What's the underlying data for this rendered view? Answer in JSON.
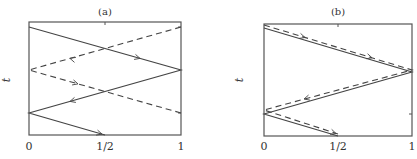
{
  "figure": {
    "panels": [
      {
        "id": "a",
        "title": "(a)",
        "ylabel": "t",
        "xticks": [
          "0",
          "1/2",
          "1"
        ],
        "frame": {
          "x": 29,
          "y": 22,
          "w": 152,
          "h": 113
        },
        "solid_path": "29,27 181,70 29,113 105,135",
        "dashed_path": "181,27 29,70 181,113",
        "arrows": [
          {
            "x": 140,
            "y": 58.4,
            "dir": "right",
            "slope": 0.283
          },
          {
            "x": 70,
            "y": 101.4,
            "dir": "left",
            "slope": -0.283
          },
          {
            "x": 102,
            "y": 134.1,
            "dir": "right",
            "slope": 0.289
          },
          {
            "x": 70,
            "y": 58.4,
            "dir": "left",
            "slope": 0.283
          },
          {
            "x": 78,
            "y": 83.9,
            "dir": "right",
            "slope": 0.283
          }
        ]
      },
      {
        "id": "b",
        "title": "(b)",
        "ylabel": "t",
        "xticks": [
          "0",
          "1/2",
          "1"
        ],
        "frame": {
          "x": 264,
          "y": 24,
          "w": 148,
          "h": 112
        },
        "solid_path": "264,28 412,72 264,114 338,136",
        "dashed_path": "264,25 412,70 264,110 338,134",
        "arrows": [
          {
            "x": 305,
            "y": 37.5,
            "dir": "right",
            "slope": 0.304
          },
          {
            "x": 372,
            "y": 57.8,
            "dir": "right",
            "slope": 0.304
          },
          {
            "x": 304,
            "y": 99.0,
            "dir": "left",
            "slope": -0.269
          },
          {
            "x": 336,
            "y": 133.5,
            "dir": "right",
            "slope": 0.324
          }
        ]
      }
    ]
  }
}
